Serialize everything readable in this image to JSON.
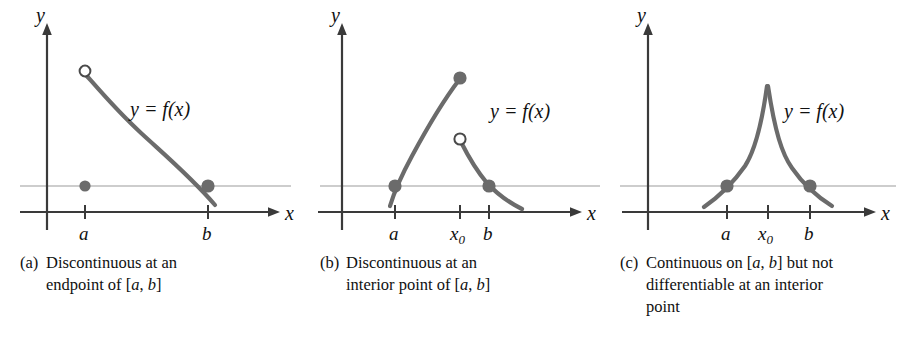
{
  "figure": {
    "type": "math-illustration",
    "panel_count": 3,
    "background_color": "#ffffff",
    "curve_color": "#6b6b6b",
    "axis_color": "#3a3a3a",
    "reference_line_color": "#b9b9b9",
    "text_color": "#111111"
  },
  "panels": [
    {
      "id": "a",
      "marker": "(a)",
      "caption_lines": [
        "Discontinuous at an",
        "endpoint of [a, b]"
      ],
      "caption_full": "(a) Discontinuous at an endpoint of [a, b]",
      "axis": {
        "x_label": "x",
        "y_label": "y",
        "tick_labels": [
          "a",
          "b"
        ]
      },
      "curve_label": "y = f(x)",
      "markers": {
        "open_circles": 1,
        "filled_dots": 3
      },
      "description": "Decreasing curve starting with an open circle above x=a; a separate filled dot sits on the reference line at x=a; curve crosses the reference line at x=b with a filled dot."
    },
    {
      "id": "b",
      "marker": "(b)",
      "caption_lines": [
        "Discontinuous at an",
        "interior point of [a, b]"
      ],
      "caption_full": "(b) Discontinuous at an interior point of [a, b]",
      "axis": {
        "x_label": "x",
        "y_label": "y",
        "tick_labels": [
          "a",
          "x₀",
          "b"
        ]
      },
      "curve_label": "y = f(x)",
      "markers": {
        "open_circles": 1,
        "filled_dots": 3
      },
      "description": "Rising concave-down branch from a filled dot at x=a to a filled dot at x=x0; a second branch begins with an open circle at x=x0 and falls through a filled dot at x=b."
    },
    {
      "id": "c",
      "marker": "(c)",
      "caption_lines": [
        "Continuous on [a, b] but not",
        "differentiable at an interior",
        "point"
      ],
      "caption_full": "(c) Continuous on [a, b] but not differentiable at an interior point",
      "axis": {
        "x_label": "x",
        "y_label": "y",
        "tick_labels": [
          "a",
          "x₀",
          "b"
        ]
      },
      "curve_label": "y = f(x)",
      "markers": {
        "open_circles": 0,
        "filled_dots": 2
      },
      "description": "Continuous cusp-shaped curve peaking sharply at x=x0, with filled dots on the reference line at x=a and x=b."
    }
  ],
  "chart_data": {
    "type": "line",
    "title": "",
    "xlabel": "x",
    "ylabel": "y",
    "grid": false,
    "legend": "none",
    "panels": [
      {
        "name": "(a) Discontinuous at an endpoint of [a, b]",
        "x_ticks": [
          "a",
          "b"
        ],
        "reference_line_y": "f(b)",
        "segments": [
          {
            "name": "main branch",
            "start": {
              "x": "a",
              "y": "high",
              "endpoint": "open"
            },
            "end": {
              "x": "b+",
              "y": "below reference",
              "endpoint": "none"
            },
            "shape": "monotone decreasing, S-curve"
          }
        ],
        "points": [
          {
            "x": "a",
            "y": "high",
            "style": "open"
          },
          {
            "x": "a",
            "y": "reference",
            "style": "filled"
          },
          {
            "x": "b",
            "y": "reference",
            "style": "filled"
          }
        ]
      },
      {
        "name": "(b) Discontinuous at an interior point of [a, b]",
        "x_ticks": [
          "a",
          "x₀",
          "b"
        ],
        "reference_line_y": "f(a)",
        "segments": [
          {
            "name": "left branch",
            "start": {
              "x": "a",
              "y": "reference",
              "endpoint": "filled"
            },
            "end": {
              "x": "x₀",
              "y": "high",
              "endpoint": "filled"
            },
            "shape": "increasing, concave down"
          },
          {
            "name": "right branch",
            "start": {
              "x": "x₀",
              "y": "mid",
              "endpoint": "open"
            },
            "end": {
              "x": "b+",
              "y": "below reference",
              "endpoint": "none"
            },
            "shape": "decreasing, convex"
          }
        ],
        "points": [
          {
            "x": "a",
            "y": "reference",
            "style": "filled"
          },
          {
            "x": "x₀",
            "y": "high",
            "style": "filled"
          },
          {
            "x": "x₀",
            "y": "mid",
            "style": "open"
          },
          {
            "x": "b",
            "y": "reference",
            "style": "filled"
          }
        ]
      },
      {
        "name": "(c) Continuous on [a, b] but not differentiable at an interior point",
        "x_ticks": [
          "a",
          "x₀",
          "b"
        ],
        "reference_line_y": "f(a) = f(b)",
        "segments": [
          {
            "name": "cusp curve",
            "start": {
              "x": "a-",
              "y": "below reference",
              "endpoint": "none"
            },
            "peak": {
              "x": "x₀",
              "y": "max",
              "endpoint": "cusp"
            },
            "end": {
              "x": "b+",
              "y": "below reference",
              "endpoint": "none"
            },
            "shape": "sharp peak (corner) at x₀"
          }
        ],
        "points": [
          {
            "x": "a",
            "y": "reference",
            "style": "filled"
          },
          {
            "x": "b",
            "y": "reference",
            "style": "filled"
          }
        ]
      }
    ]
  }
}
